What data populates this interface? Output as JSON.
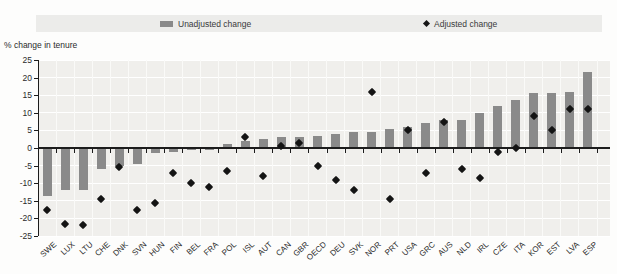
{
  "legend": {
    "unadjusted_label": "Unadjusted change",
    "adjusted_label": "Adjusted change"
  },
  "axis_note": "% change in tenure",
  "colors": {
    "bar": "#8a8a8a",
    "diamond": "#141414",
    "plot_background": "#f0efec",
    "legend_background": "#ececea",
    "gridline": "#ffffff",
    "axis": "#1c1c1c"
  },
  "chart_data": {
    "type": "bar",
    "title": "",
    "xlabel": "",
    "ylabel": "% change in tenure",
    "ylim": [
      -25,
      25
    ],
    "yticks": [
      25,
      20,
      15,
      10,
      5,
      0,
      -5,
      -10,
      -15,
      -20,
      -25
    ],
    "grid": true,
    "legend_position": "top",
    "categories": [
      "SWE",
      "LUX",
      "LTU",
      "CHE",
      "DNK",
      "SVN",
      "HUN",
      "FIN",
      "BEL",
      "FRA",
      "POL",
      "ISL",
      "AUT",
      "CAN",
      "GBR",
      "OECD",
      "DEU",
      "SVK",
      "NOR",
      "PRT",
      "USA",
      "GRC",
      "AUS",
      "NLD",
      "IRL",
      "CZE",
      "ITA",
      "KOR",
      "EST",
      "LVA",
      "ESP"
    ],
    "series": [
      {
        "name": "Unadjusted change",
        "type": "bar",
        "color": "#8a8a8a",
        "values": [
          -13.5,
          -12,
          -12,
          -6,
          -5,
          -4.5,
          -1.5,
          -1,
          -0.5,
          -0.5,
          1,
          2,
          2.5,
          3,
          3,
          3.5,
          4,
          4.5,
          4.5,
          5.5,
          6,
          7,
          8,
          8,
          10,
          12,
          13.5,
          15.5,
          15.5,
          16,
          21.5
        ]
      },
      {
        "name": "Adjusted change",
        "type": "scatter-diamond",
        "color": "#141414",
        "values": [
          -17.5,
          -21.5,
          -22,
          -14.5,
          -5.5,
          -17.5,
          -15.5,
          -7,
          -10,
          -11,
          -6.5,
          3,
          -8,
          0.5,
          1.5,
          -5,
          -9,
          -12,
          16,
          -14.5,
          5,
          -7,
          7.5,
          -6,
          -8.5,
          -1,
          0,
          9,
          5,
          11,
          11
        ]
      }
    ]
  }
}
